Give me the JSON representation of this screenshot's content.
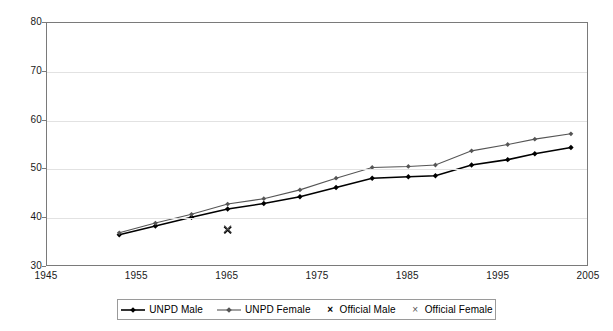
{
  "chart_data": {
    "type": "line",
    "title": "",
    "subtitle": "",
    "xlabel": "",
    "ylabel": "",
    "xlim": [
      1945,
      2005
    ],
    "ylim": [
      30,
      80
    ],
    "xticks": [
      1945,
      1955,
      1965,
      1975,
      1985,
      1995,
      2005
    ],
    "yticks": [
      30,
      40,
      50,
      60,
      70,
      80
    ],
    "grid": "horizontal",
    "legend_position": "bottom-center",
    "series": [
      {
        "name": "UNPD Male",
        "type": "line",
        "marker": "diamond",
        "color": "#000000",
        "x": [
          1953,
          1957,
          1961,
          1965,
          1969,
          1973,
          1977,
          1981,
          1985,
          1988,
          1992,
          1996,
          1999,
          2003
        ],
        "values": [
          36.6,
          38.4,
          40.2,
          41.9,
          43.0,
          44.4,
          46.3,
          48.2,
          48.5,
          48.7,
          50.9,
          52.0,
          53.2,
          54.5
        ]
      },
      {
        "name": "UNPD Female",
        "type": "line",
        "marker": "diamond",
        "color": "#555555",
        "x": [
          1953,
          1957,
          1961,
          1965,
          1969,
          1973,
          1977,
          1981,
          1985,
          1988,
          1992,
          1996,
          1999,
          2003
        ],
        "values": [
          37.0,
          39.0,
          40.8,
          42.9,
          44.0,
          45.8,
          48.2,
          50.4,
          50.6,
          50.9,
          53.8,
          55.1,
          56.2,
          57.3
        ]
      },
      {
        "name": "Official Male",
        "type": "scatter",
        "marker": "x-bold",
        "color": "#000000",
        "x": [
          1965
        ],
        "values": [
          37.6
        ]
      },
      {
        "name": "Official Female",
        "type": "scatter",
        "marker": "x-light",
        "color": "#555555",
        "x": [
          1965
        ],
        "values": [
          37.8
        ]
      }
    ]
  },
  "legend": {
    "entries": [
      {
        "label": "UNPD Male",
        "marker": "line-diamond-dark"
      },
      {
        "label": "UNPD Female",
        "marker": "line-diamond-gray"
      },
      {
        "label": "Official Male",
        "marker": "x-bold"
      },
      {
        "label": "Official Female",
        "marker": "x-light"
      }
    ]
  },
  "axes": {
    "y_labels": [
      "80",
      "70",
      "60",
      "50",
      "40",
      "30"
    ],
    "x_labels": [
      "1945",
      "1955",
      "1965",
      "1975",
      "1985",
      "1995",
      "2005"
    ]
  },
  "colors": {
    "series_male": "#000000",
    "series_female": "#555555",
    "grid": "#e2e2e2",
    "frame": "#7a7a7a",
    "background": "#ffffff"
  }
}
